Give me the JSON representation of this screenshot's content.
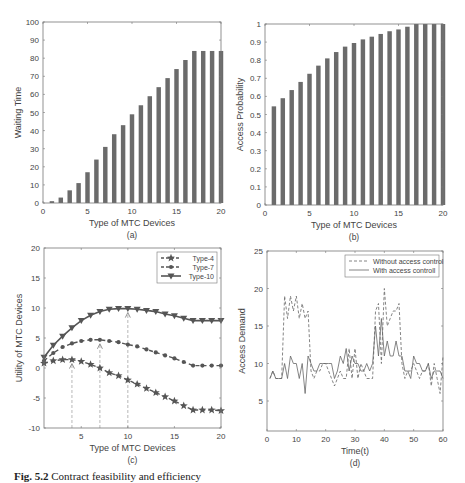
{
  "figure": {
    "caption_label": "Fig. 5.2",
    "caption_text": "Contract feasibility and efficiency"
  },
  "chart_data": [
    {
      "id": "a",
      "type": "bar",
      "panel_label": "(a)",
      "title": "",
      "xlabel": "Type of MTC Devices",
      "ylabel": "Waiting Time",
      "categories": [
        1,
        2,
        3,
        4,
        5,
        6,
        7,
        8,
        9,
        10,
        11,
        12,
        13,
        14,
        15,
        16,
        17,
        18,
        19,
        20
      ],
      "values": [
        1,
        3,
        7,
        11,
        17,
        24,
        31,
        38,
        43,
        49,
        54,
        59,
        64,
        69,
        74,
        79,
        84,
        84,
        84,
        84
      ],
      "xlim": [
        0,
        20
      ],
      "ylim": [
        0,
        100
      ],
      "xticks": [
        0,
        5,
        10,
        15,
        20
      ],
      "yticks": [
        0,
        10,
        20,
        30,
        40,
        50,
        60,
        70,
        80,
        90,
        100
      ],
      "grid": false,
      "bar_color": "#6b6b6b",
      "plot_box": {
        "x0": 43,
        "y0": 22,
        "x1": 221,
        "y1": 203
      }
    },
    {
      "id": "b",
      "type": "bar",
      "panel_label": "(b)",
      "title": "",
      "xlabel": "Type of MTC Devices",
      "ylabel": "Access Probability",
      "categories": [
        1,
        2,
        3,
        4,
        5,
        6,
        7,
        8,
        9,
        10,
        11,
        12,
        13,
        14,
        15,
        16,
        17,
        18,
        19,
        20
      ],
      "values": [
        0.545,
        0.59,
        0.635,
        0.68,
        0.725,
        0.77,
        0.81,
        0.845,
        0.875,
        0.895,
        0.915,
        0.93,
        0.945,
        0.96,
        0.97,
        0.985,
        1.0,
        1.0,
        1.0,
        1.0
      ],
      "xlim": [
        0,
        20
      ],
      "ylim": [
        0,
        1
      ],
      "xticks": [
        0,
        5,
        10,
        15,
        20
      ],
      "yticks": [
        0,
        0.1,
        0.2,
        0.3,
        0.4,
        0.5,
        0.6,
        0.7,
        0.8,
        0.9,
        1
      ],
      "grid": false,
      "bar_color": "#6b6b6b",
      "plot_box": {
        "x0": 265,
        "y0": 24,
        "x1": 443,
        "y1": 205
      }
    },
    {
      "id": "c",
      "type": "line",
      "panel_label": "(c)",
      "title": "",
      "xlabel": "Type of MTC Devices",
      "ylabel": "Utility of MTC Devices",
      "x": [
        1,
        2,
        3,
        4,
        5,
        6,
        7,
        8,
        9,
        10,
        11,
        12,
        13,
        14,
        15,
        16,
        17,
        18,
        19,
        20
      ],
      "series": [
        {
          "name": "Type-4",
          "marker": "star",
          "linestyle": "dashed",
          "values": [
            0.8,
            1.2,
            1.4,
            1.4,
            1.1,
            0.6,
            0.0,
            -0.8,
            -1.3,
            -2.0,
            -2.7,
            -3.4,
            -4.1,
            -4.8,
            -5.5,
            -6.3,
            -7.0,
            -7.0,
            -7.0,
            -7.1
          ]
        },
        {
          "name": "Type-7",
          "marker": "circle",
          "linestyle": "dashed",
          "values": [
            1.2,
            2.5,
            3.5,
            4.1,
            4.5,
            4.7,
            4.7,
            4.5,
            4.3,
            3.9,
            3.6,
            3.1,
            2.6,
            2.1,
            1.6,
            1.0,
            0.4,
            0.4,
            0.4,
            0.4
          ]
        },
        {
          "name": "Type-10",
          "marker": "triangle-down",
          "linestyle": "solid",
          "values": [
            1.8,
            3.8,
            5.3,
            6.7,
            7.9,
            8.8,
            9.4,
            9.8,
            9.9,
            9.9,
            9.8,
            9.6,
            9.4,
            9.0,
            8.7,
            8.3,
            7.9,
            7.9,
            7.9,
            7.9
          ]
        }
      ],
      "annotations": [
        {
          "x": 4,
          "from": -10,
          "to": 1.4,
          "style": "dashed-arrow"
        },
        {
          "x": 7,
          "from": -10,
          "to": 4.7,
          "style": "dashed-arrow"
        },
        {
          "x": 10,
          "from": -10,
          "to": 9.9,
          "style": "dashed-arrow"
        }
      ],
      "xlim": [
        1,
        20
      ],
      "ylim": [
        -10,
        20
      ],
      "xticks": [
        5,
        10,
        15,
        20
      ],
      "yticks": [
        -10,
        -5,
        0,
        5,
        10,
        15,
        20
      ],
      "grid": false,
      "legend_position": "upper right",
      "line_color": "#555555",
      "plot_box": {
        "x0": 44,
        "y0": 248,
        "x1": 221,
        "y1": 428
      }
    },
    {
      "id": "d",
      "type": "line",
      "panel_label": "(d)",
      "title": "",
      "xlabel": "Time(t)",
      "ylabel": "Access Demand",
      "x": [
        1,
        2,
        3,
        4,
        5,
        6,
        7,
        8,
        9,
        10,
        11,
        12,
        13,
        14,
        15,
        16,
        17,
        18,
        19,
        20,
        21,
        22,
        23,
        24,
        25,
        26,
        27,
        28,
        29,
        30,
        31,
        32,
        33,
        34,
        35,
        36,
        37,
        38,
        39,
        40,
        41,
        42,
        43,
        44,
        45,
        46,
        47,
        48,
        49,
        50,
        51,
        52,
        53,
        54,
        55,
        56,
        57,
        58,
        59,
        60
      ],
      "series": [
        {
          "name": "Without access control",
          "linestyle": "dashed",
          "values": [
            8,
            9,
            8,
            8,
            8,
            19,
            16,
            19,
            17,
            19,
            16,
            18,
            16,
            17,
            9,
            8,
            9,
            9,
            10,
            10,
            9,
            8,
            7,
            8,
            9,
            8,
            8,
            12,
            8,
            12,
            8,
            10,
            9,
            8,
            8,
            8,
            17,
            18,
            10,
            20,
            15,
            16,
            17,
            17,
            18,
            10,
            8,
            9,
            9,
            10,
            9,
            8,
            9,
            9,
            10,
            7,
            10,
            8,
            6,
            11
          ]
        },
        {
          "name": "With access controll",
          "linestyle": "solid",
          "values": [
            8,
            9,
            8,
            8,
            8,
            10,
            8,
            11,
            10,
            10,
            8,
            10,
            6,
            11,
            10,
            9,
            9,
            10,
            10,
            10,
            10,
            10,
            8,
            9,
            11,
            10,
            12,
            9,
            11,
            10,
            10,
            9,
            9,
            10,
            9,
            10,
            15,
            11,
            16,
            11,
            13,
            11,
            11,
            13,
            11,
            11,
            9,
            9,
            8,
            11,
            10,
            10,
            9,
            9,
            10,
            8,
            9,
            9,
            9,
            8
          ]
        }
      ],
      "xlim": [
        0,
        60
      ],
      "ylim": [
        1,
        25
      ],
      "xticks": [
        0,
        10,
        20,
        30,
        40,
        50,
        60
      ],
      "yticks": [
        5,
        10,
        15,
        20,
        25
      ],
      "grid": false,
      "legend_position": "upper right",
      "line_color": "#666666",
      "plot_box": {
        "x0": 267,
        "y0": 251,
        "x1": 443,
        "y1": 431
      }
    }
  ]
}
